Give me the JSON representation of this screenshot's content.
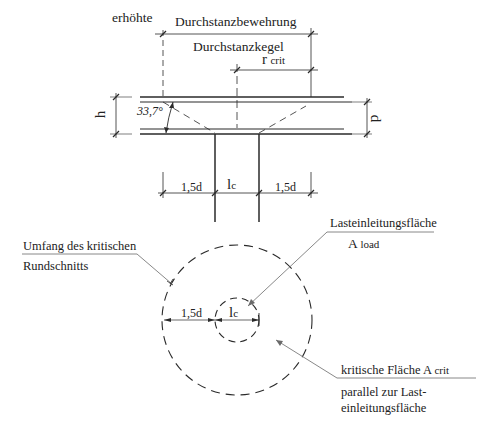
{
  "section_view": {
    "label_increased": "erhöhte",
    "label_reinforcement": "Durchstanzbewehrung",
    "label_cone": "Durchstanzkegel",
    "label_rcrit_main": "r",
    "label_rcrit_sub": "crit",
    "label_h": "h",
    "label_d": "d",
    "label_angle": "33,7°",
    "dim_left": "1,5d",
    "dim_col_main": "l",
    "dim_col_sub": "c",
    "dim_right": "1,5d"
  },
  "plan_view": {
    "label_perimeter_line1": "Umfang des kritischen",
    "label_perimeter_line2": "Rundschnitts",
    "label_load_area": "Lasteinleitungsfläche",
    "label_aload_main": "A",
    "label_aload_sub": "load",
    "dim_left": "1,5d",
    "dim_col_main": "l",
    "dim_col_sub": "c",
    "label_crit_area_main": "kritische Fläche A",
    "label_crit_area_sub": "crit",
    "label_parallel_line1": "parallel zur Last-",
    "label_parallel_line2": "einleitungsfläche"
  },
  "colors": {
    "line": "#2a2a2a",
    "leader": "#6a6a6a",
    "background": "#ffffff"
  }
}
